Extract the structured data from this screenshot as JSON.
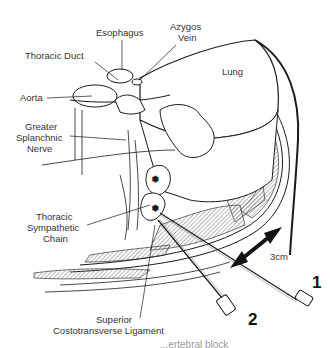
{
  "figure": {
    "labels": {
      "esophagus": "Esophagus",
      "azygos_vein_line1": "Azygos",
      "azygos_vein_line2": "Vein",
      "thoracic_duct": "Thoracic Duct",
      "lung": "Lung",
      "aorta": "Aorta",
      "greater_splanchnic_line1": "Greater",
      "greater_splanchnic_line2": "Splanchnic",
      "greater_splanchnic_line3": "Nerve",
      "thoracic_sympathetic_line1": "Thoracic",
      "thoracic_sympathetic_line2": "Sympathetic",
      "thoracic_sympathetic_line3": "Chain",
      "ligament_line1": "Superior",
      "ligament_line2": "Costotransverse Ligament"
    },
    "measurement": "3cm",
    "needles": [
      {
        "id": "1",
        "label": "1"
      },
      {
        "id": "2",
        "label": "2"
      }
    ],
    "caption_fragment": "...ertebral block"
  },
  "colors": {
    "line": "#1a1a1a",
    "hatch": "#9a9a9a",
    "background": "#ffffff"
  }
}
